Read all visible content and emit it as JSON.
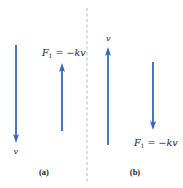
{
  "figure": {
    "arrow_color": "#3566c0",
    "divider_color": "#aaaaaa",
    "panels": [
      {
        "id": "a",
        "label": "(a)",
        "velocity_label": "v",
        "force_label_main": "F",
        "force_label_sub": "1",
        "force_label_rest": " = −kv",
        "velocity_direction": "down",
        "force_direction": "up"
      },
      {
        "id": "b",
        "label": "(b)",
        "velocity_label": "v",
        "force_label_main": "F",
        "force_label_sub": "1",
        "force_label_rest": " = −kv",
        "velocity_direction": "up",
        "force_direction": "down"
      }
    ]
  }
}
